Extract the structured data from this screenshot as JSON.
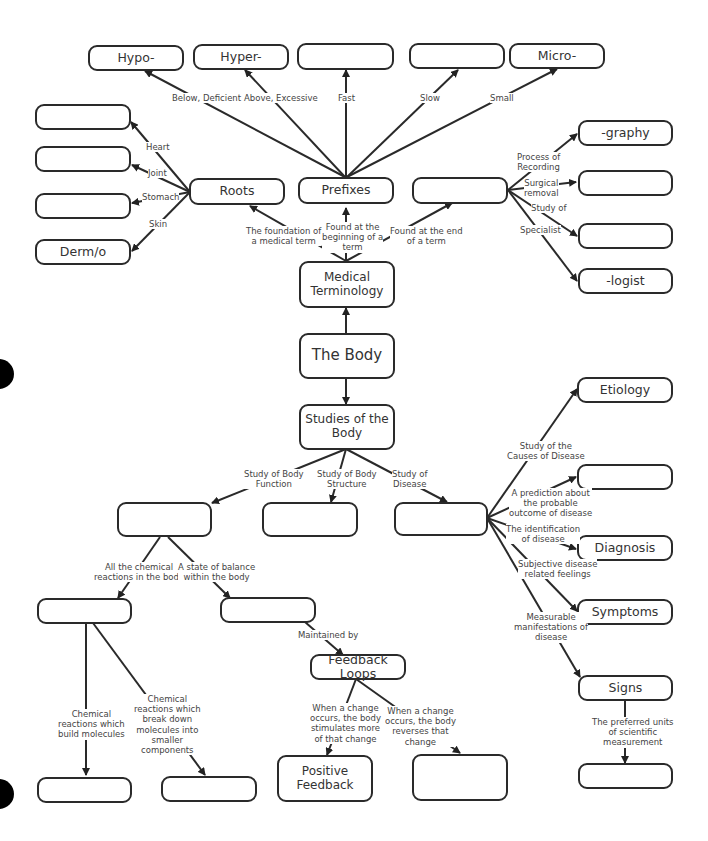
{
  "diagram": {
    "nodes": {
      "hypo": "Hypo-",
      "hyper": "Hyper-",
      "fast_blank": "",
      "slow_blank": "",
      "micro": "Micro-",
      "heart_blank": "",
      "joint_blank": "",
      "stomach_blank": "",
      "dermo": "Derm/o",
      "roots": "Roots",
      "prefixes": "Prefixes",
      "suffixes_blank": "",
      "graphy": "-graphy",
      "surgical_blank": "",
      "studyof_blank": "",
      "logist": "-logist",
      "medical_terminology": "Medical Terminology",
      "the_body": "The Body",
      "studies_of_body": "Studies of the Body",
      "function_blank": "",
      "structure_blank": "",
      "disease_blank": "",
      "etiology": "Etiology",
      "prognosis_blank": "",
      "diagnosis": "Diagnosis",
      "symptoms": "Symptoms",
      "signs": "Signs",
      "units_blank": "",
      "metabolism_blank": "",
      "homeostasis_blank": "",
      "feedback_loops": "Feedback Loops",
      "anabolism_blank": "",
      "catabolism_blank": "",
      "positive_feedback": "Positive Feedback",
      "negative_blank": ""
    },
    "labels": {
      "below": "Below, Deficient",
      "above": "Above, Excessive",
      "fast": "Fast",
      "slow": "Slow",
      "small": "Small",
      "heart": "Heart",
      "joint": "Joint",
      "stomach": "Stomach",
      "skin": "Skin",
      "foundation": "The foundation of\na medical term",
      "beginning": "Found at the\nbeginning of a\nterm",
      "end": "Found at the end\nof a term",
      "recording": "Process of\nRecording",
      "surgical": "Surgical\nremoval",
      "study_of": "Study of",
      "specialist": "Specialist",
      "body_function": "Study of Body\nFunction",
      "body_structure": "Study of Body\nStructure",
      "study_disease": "Study of\nDisease",
      "causes": "Study of the\nCauses of Disease",
      "prediction": "A prediction about\nthe probable\noutcome of disease",
      "identification": "The identification\nof disease",
      "subjective": "Subjective disease\nrelated feelings",
      "measurable": "Measurable\nmanifestations of\ndisease",
      "units": "The preferred units\nof scientific\nmeasurement",
      "chemical_all": "All the chemical\nreactions in the body",
      "balance": "A state of balance\nwithin the body",
      "maintained": "Maintained by",
      "build": "Chemical\nreactions which\nbuild molecules",
      "break": "Chemical\nreactions which\nbreak down\nmolecules into\nsmaller\ncomponents",
      "stimulates": "When a change\noccurs, the body\nstimulates more\nof that change",
      "reverses": "When a change\noccurs, the body\nreverses that\nchange"
    },
    "colors": {
      "stroke": "#2a2a2a",
      "text": "#333333",
      "background": "#ffffff"
    }
  }
}
